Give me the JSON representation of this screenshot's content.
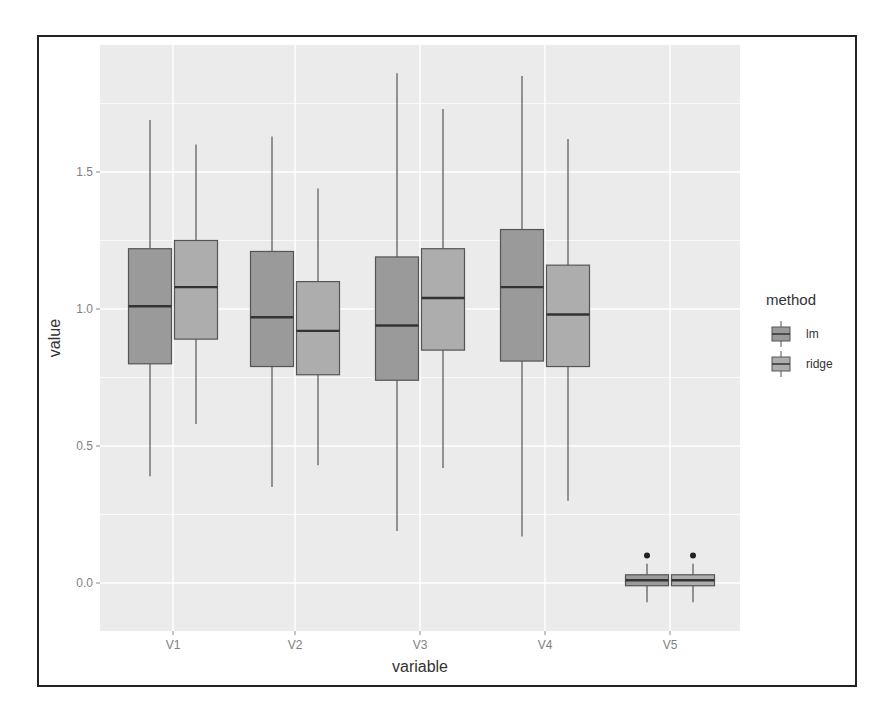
{
  "chart_data": {
    "type": "boxplot",
    "title": "",
    "xlabel": "variable",
    "ylabel": "value",
    "categories": [
      "V1",
      "V2",
      "V3",
      "V4",
      "V5"
    ],
    "yticks": [
      "0.0",
      "0.5",
      "1.0",
      "1.5"
    ],
    "ytick_values": [
      0.0,
      0.5,
      1.0,
      1.5
    ],
    "ylim": [
      -0.14,
      1.94
    ],
    "grid": true,
    "legend": {
      "title": "method",
      "position": "right",
      "entries": [
        "lm",
        "ridge"
      ]
    },
    "series": [
      {
        "name": "lm",
        "color": "#9a9a9a",
        "boxes": [
          {
            "category": "V1",
            "min": 0.39,
            "q1": 0.8,
            "median": 1.01,
            "q3": 1.22,
            "max": 1.69,
            "outliers": []
          },
          {
            "category": "V2",
            "min": 0.35,
            "q1": 0.79,
            "median": 0.97,
            "q3": 1.21,
            "max": 1.63,
            "outliers": []
          },
          {
            "category": "V3",
            "min": 0.19,
            "q1": 0.74,
            "median": 0.94,
            "q3": 1.19,
            "max": 1.86,
            "outliers": []
          },
          {
            "category": "V4",
            "min": 0.17,
            "q1": 0.81,
            "median": 1.08,
            "q3": 1.29,
            "max": 1.85,
            "outliers": []
          },
          {
            "category": "V5",
            "min": -0.07,
            "q1": -0.01,
            "median": 0.01,
            "q3": 0.03,
            "max": 0.07,
            "outliers": [
              0.1
            ]
          }
        ]
      },
      {
        "name": "ridge",
        "color": "#adadad",
        "boxes": [
          {
            "category": "V1",
            "min": 0.58,
            "q1": 0.89,
            "median": 1.08,
            "q3": 1.25,
            "max": 1.6,
            "outliers": []
          },
          {
            "category": "V2",
            "min": 0.43,
            "q1": 0.76,
            "median": 0.92,
            "q3": 1.1,
            "max": 1.44,
            "outliers": []
          },
          {
            "category": "V3",
            "min": 0.42,
            "q1": 0.85,
            "median": 1.04,
            "q3": 1.22,
            "max": 1.73,
            "outliers": []
          },
          {
            "category": "V4",
            "min": 0.3,
            "q1": 0.79,
            "median": 0.98,
            "q3": 1.16,
            "max": 1.62,
            "outliers": []
          },
          {
            "category": "V5",
            "min": -0.07,
            "q1": -0.01,
            "median": 0.01,
            "q3": 0.03,
            "max": 0.07,
            "outliers": [
              0.1
            ]
          }
        ]
      }
    ]
  },
  "style": {
    "panel_bg": "#ebebeb",
    "grid_color": "#ffffff",
    "box_outline": "#555555",
    "median_color": "#333333",
    "axis_text": "#7f7f7f",
    "label_text": "#333333"
  }
}
